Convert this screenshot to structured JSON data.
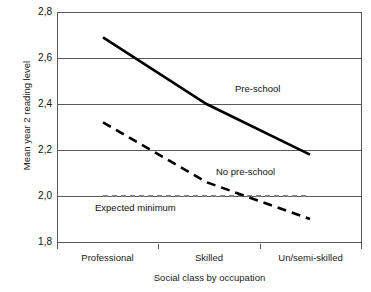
{
  "chart_data": {
    "type": "line",
    "title": "",
    "xlabel": "Social class by occupation",
    "ylabel": "Mean year 2 reading level",
    "categories": [
      "Professional",
      "Skilled",
      "Un/semi-skilled"
    ],
    "x": [
      0,
      1,
      2
    ],
    "ylim": [
      1.8,
      2.8
    ],
    "yticks": [
      "1,8",
      "2,0",
      "2,2",
      "2,4",
      "2,6",
      "2,8"
    ],
    "ytick_values": [
      1.8,
      2.0,
      2.2,
      2.4,
      2.6,
      2.8
    ],
    "grid": true,
    "legend_position": "inline-annotations",
    "series": [
      {
        "name": "Pre-school",
        "style": "solid",
        "color": "#000000",
        "width": 2.6,
        "values": [
          2.69,
          2.4,
          2.18
        ]
      },
      {
        "name": "No pre-school",
        "style": "dashed",
        "color": "#000000",
        "width": 2.6,
        "values": [
          2.32,
          2.06,
          1.9
        ]
      },
      {
        "name": "Expected minimum",
        "style": "dashed",
        "color": "#808080",
        "width": 2.2,
        "values": [
          2.0,
          2.0,
          2.0
        ]
      }
    ],
    "annotations": [
      {
        "text": "Pre-school",
        "x_px": 235,
        "y_px": 83
      },
      {
        "text": "No pre-school",
        "x_px": 216,
        "y_px": 166
      },
      {
        "text": "Expected minimum",
        "x_px": 95,
        "y_px": 202
      }
    ]
  },
  "axis": {
    "y_title": "Mean year 2 reading level",
    "x_title": "Social class by occupation",
    "y_labels": {
      "t28": "2,8",
      "t26": "2,6",
      "t24": "2,4",
      "t22": "2,2",
      "t20": "2,0",
      "t18": "1,8"
    },
    "x_labels": {
      "c0": "Professional",
      "c1": "Skilled",
      "c2": "Un/semi-skilled"
    }
  },
  "labels": {
    "preschool": "Pre-school",
    "no_preschool": "No pre-school",
    "expected_minimum": "Expected minimum"
  },
  "colors": {
    "line": "#000000",
    "expected_minimum_line": "#808080",
    "grid": "#5a5a5a",
    "axis": "#555555",
    "text": "#1a1a1a",
    "background": "#ffffff"
  }
}
